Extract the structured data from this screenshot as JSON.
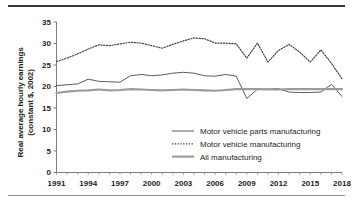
{
  "chart_data": {
    "type": "line",
    "title": "",
    "xlabel": "",
    "ylabel": "Real average hourly earnings\n(constant $, 2002)",
    "xlim": [
      1991,
      2018
    ],
    "ylim": [
      0,
      35
    ],
    "ytick_values": [
      0,
      5,
      10,
      15,
      20,
      25,
      30,
      35
    ],
    "ytick_labels": [
      "0",
      "5",
      "10",
      "15",
      "20",
      "25",
      "30",
      "35"
    ],
    "xtick_values": [
      1991,
      1994,
      1997,
      2000,
      2003,
      2006,
      2009,
      2012,
      2015,
      2018
    ],
    "xtick_labels": [
      "1991",
      "1994",
      "1997",
      "2000",
      "2003",
      "2006",
      "2009",
      "2012",
      "2015",
      "2018"
    ],
    "x_minor_ticks": [
      1991,
      1992,
      1993,
      1994,
      1995,
      1996,
      1997,
      1998,
      1999,
      2000,
      2001,
      2002,
      2003,
      2004,
      2005,
      2006,
      2007,
      2008,
      2009,
      2010,
      2011,
      2012,
      2013,
      2014,
      2015,
      2016,
      2017,
      2018
    ],
    "grid": false,
    "legend_position": "center-right",
    "x": [
      1991,
      1992,
      1993,
      1994,
      1995,
      1996,
      1997,
      1998,
      1999,
      2000,
      2001,
      2002,
      2003,
      2004,
      2005,
      2006,
      2007,
      2008,
      2009,
      2010,
      2011,
      2012,
      2013,
      2014,
      2015,
      2016,
      2017,
      2018
    ],
    "series": [
      {
        "name": "Motor vehicle parts manufacturing",
        "style": "solid-thin",
        "color": "#3f3f3f",
        "values": [
          20.2,
          20.4,
          20.6,
          21.7,
          21.2,
          21.1,
          21.0,
          22.5,
          22.8,
          22.5,
          22.7,
          23.1,
          23.3,
          23.1,
          22.5,
          22.4,
          22.8,
          22.4,
          17.2,
          19.4,
          19.4,
          19.5,
          18.7,
          18.6,
          18.6,
          18.7,
          20.5,
          17.7
        ]
      },
      {
        "name": "Motor vehicle manufacturing",
        "style": "dotted",
        "color": "#3f3f3f",
        "values": [
          25.8,
          26.6,
          27.6,
          28.7,
          29.7,
          29.5,
          29.9,
          30.3,
          30.1,
          29.5,
          28.9,
          29.8,
          30.6,
          31.3,
          31.1,
          30.1,
          30.1,
          29.9,
          26.6,
          30.1,
          25.7,
          28.4,
          29.8,
          28.0,
          25.7,
          28.5,
          25.4,
          21.8
        ]
      },
      {
        "name": "All manufacturing",
        "style": "solid-thick",
        "color": "#9b9b9b",
        "values": [
          18.5,
          18.8,
          19.0,
          19.1,
          19.3,
          19.1,
          19.2,
          19.4,
          19.3,
          19.2,
          19.1,
          19.2,
          19.3,
          19.2,
          19.1,
          19.0,
          19.2,
          19.4,
          19.4,
          19.4,
          19.3,
          19.3,
          19.4,
          19.4,
          19.4,
          19.4,
          19.4,
          19.4
        ]
      }
    ],
    "legend": [
      {
        "label": "Motor vehicle parts manufacturing",
        "style": "solid-thin",
        "color": "#3f3f3f"
      },
      {
        "label": "Motor vehicle manufacturing",
        "style": "dotted",
        "color": "#3f3f3f"
      },
      {
        "label": "All manufacturing",
        "style": "solid-thick",
        "color": "#9b9b9b"
      }
    ]
  }
}
